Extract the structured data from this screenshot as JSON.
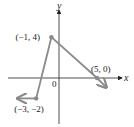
{
  "chart_data": {
    "type": "line",
    "title": "",
    "xlabel": "x",
    "ylabel": "y",
    "origin_label": "0",
    "xlim": [
      -5,
      7
    ],
    "ylim": [
      -5,
      7
    ],
    "grid": false,
    "series": [
      {
        "name": "piecewise",
        "points": [
          {
            "x": -5.4,
            "y": -2,
            "arrow": true
          },
          {
            "x": -3,
            "y": -2,
            "label": "(−3, −2)",
            "dot": true
          },
          {
            "x": -1,
            "y": 4,
            "label": "(−1, 4)",
            "dot": true
          },
          {
            "x": 5,
            "y": 0,
            "label": "(5, 0)",
            "dot": true
          },
          {
            "x": 6.2,
            "y": -0.9,
            "arrow": true
          }
        ]
      }
    ],
    "colors": {
      "line": "#8a8a8a",
      "axis": "#222222",
      "dot": "#8a8a8a"
    }
  }
}
